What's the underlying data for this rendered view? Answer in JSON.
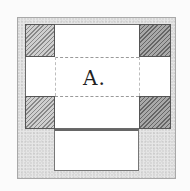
{
  "diagram": {
    "label": "A.",
    "colors": {
      "background": "#fbfbfb",
      "outer_fill": "#e6e6e6",
      "panel_fill": "#ffffff",
      "hatch": "#888888"
    },
    "regions": {
      "outer_frame": "stippled gray square",
      "corner_blocks": [
        "top-left",
        "top-right",
        "bottom-left",
        "bottom-right"
      ],
      "fold_lines": [
        "dashed horizontal top",
        "dashed horizontal bottom",
        "dashed vertical left",
        "dashed vertical right"
      ],
      "bottom_flap": "white rectangle below panel"
    }
  }
}
